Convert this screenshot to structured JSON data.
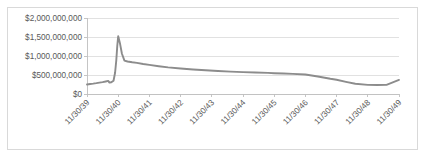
{
  "chart_data": {
    "type": "line",
    "title": "",
    "subtitle": "",
    "xlabel": "",
    "ylabel": "",
    "grid": true,
    "legend": false,
    "legend_position": "none",
    "line_color": "#8c8c8c",
    "plot_border_color": "#d9d9d9",
    "gridline_color": "#d9d9d9",
    "axis_color": "#bfbfbf",
    "ylim": [
      0,
      2000000000
    ],
    "ytick_values": [
      0,
      500000000,
      1000000000,
      1500000000,
      2000000000
    ],
    "ytick_labels": [
      "$0",
      "$500,000,000",
      "$1,000,000,000",
      "$1,500,000,000",
      "$2,000,000,000"
    ],
    "xtick_labels": [
      "11/30/39",
      "11/30/40",
      "11/30/41",
      "11/30/42",
      "11/30/43",
      "11/30/44",
      "11/30/45",
      "11/30/46",
      "11/30/47",
      "11/30/48",
      "11/30/49"
    ],
    "xtick_label_rotation_deg": 45,
    "x": [
      0.0,
      0.1,
      0.2,
      0.3,
      0.4,
      0.5,
      0.6,
      0.68,
      0.72,
      0.78,
      0.85,
      0.9,
      0.94,
      0.97,
      1.0,
      1.06,
      1.12,
      1.2,
      1.3,
      1.45,
      1.6,
      1.8,
      2.0,
      2.3,
      2.6,
      3.0,
      3.4,
      3.8,
      4.2,
      4.6,
      5.0,
      5.4,
      5.8,
      6.0,
      6.3,
      6.6,
      7.0,
      7.4,
      7.8,
      8.0,
      8.3,
      8.6,
      9.0,
      9.3,
      9.6,
      10.0
    ],
    "y": [
      250000000,
      262000000,
      272000000,
      285000000,
      300000000,
      312000000,
      330000000,
      345000000,
      300000000,
      310000000,
      350000000,
      560000000,
      900000000,
      1260000000,
      1520000000,
      1320000000,
      1060000000,
      880000000,
      855000000,
      835000000,
      820000000,
      790000000,
      765000000,
      730000000,
      700000000,
      670000000,
      645000000,
      625000000,
      605000000,
      590000000,
      575000000,
      565000000,
      555000000,
      548000000,
      540000000,
      530000000,
      512000000,
      460000000,
      400000000,
      375000000,
      320000000,
      270000000,
      240000000,
      235000000,
      240000000,
      370000000
    ],
    "series": [
      {
        "name": "value",
        "values": [
          250000000,
          262000000,
          272000000,
          285000000,
          300000000,
          312000000,
          330000000,
          345000000,
          300000000,
          310000000,
          350000000,
          560000000,
          900000000,
          1260000000,
          1520000000,
          1320000000,
          1060000000,
          880000000,
          855000000,
          835000000,
          820000000,
          790000000,
          765000000,
          730000000,
          700000000,
          670000000,
          645000000,
          625000000,
          605000000,
          590000000,
          575000000,
          565000000,
          555000000,
          548000000,
          540000000,
          530000000,
          512000000,
          460000000,
          400000000,
          375000000,
          320000000,
          270000000,
          240000000,
          235000000,
          240000000,
          370000000
        ]
      }
    ],
    "annotations": [
      {
        "label": "peak",
        "x": 1.0,
        "y": 1520000000
      },
      {
        "label": "trough",
        "x": 9.3,
        "y": 235000000
      }
    ],
    "plot_area": {
      "left": 86,
      "right": 398,
      "top": 17,
      "bottom": 93
    }
  }
}
